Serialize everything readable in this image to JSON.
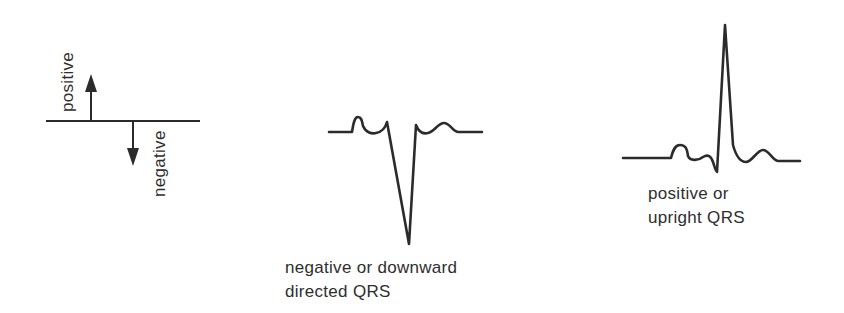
{
  "legend": {
    "positive_label": "positive",
    "negative_label": "negative"
  },
  "waveforms": [
    {
      "id": "negative-qrs",
      "caption_line1": "negative or downward",
      "caption_line2": "directed QRS"
    },
    {
      "id": "positive-qrs",
      "caption_line1": "positive or",
      "caption_line2": "upright QRS"
    }
  ],
  "colors": {
    "stroke": "#2b2b2b",
    "background": "#ffffff"
  }
}
